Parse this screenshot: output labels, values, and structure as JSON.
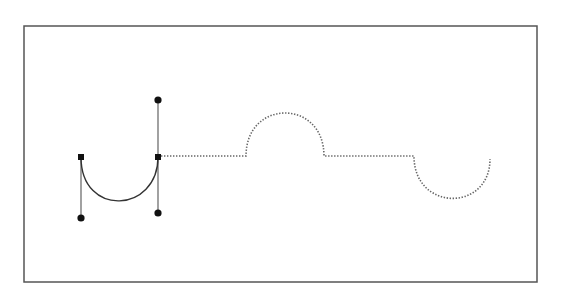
{
  "diagram": {
    "type": "bezier-path-illustration",
    "canvas": {
      "width": 564,
      "height": 299,
      "background": "#ffffff"
    },
    "frame": {
      "x": 24,
      "y": 26,
      "width": 513,
      "height": 256,
      "stroke": "#555555"
    },
    "solid_segment": {
      "description": "Drawn curve between two anchor points",
      "start": [
        81,
        157
      ],
      "control1": [
        81,
        218
      ],
      "control2": [
        158,
        213
      ],
      "end": [
        158,
        157
      ],
      "stroke": "#333333"
    },
    "anchors": [
      {
        "id": "anchor-left",
        "shape": "square",
        "x": 81,
        "y": 157
      },
      {
        "id": "anchor-right",
        "shape": "square",
        "x": 158,
        "y": 157
      }
    ],
    "handles": [
      {
        "id": "handle-left-bottom",
        "anchor": "anchor-left",
        "x": 81,
        "y": 218
      },
      {
        "id": "handle-right-top",
        "anchor": "anchor-right",
        "x": 158,
        "y": 100
      },
      {
        "id": "handle-right-bottom",
        "anchor": "anchor-right",
        "x": 158,
        "y": 213
      }
    ],
    "dotted_preview": {
      "description": "Dotted guide of the path still to be traced",
      "stroke": "#666666",
      "segments": [
        {
          "kind": "line",
          "from": [
            161,
            156
          ],
          "to": [
            246,
            156
          ]
        },
        {
          "kind": "arc-up",
          "from": [
            246,
            156
          ],
          "apex": [
            286,
            113
          ],
          "to": [
            324,
            156
          ]
        },
        {
          "kind": "line",
          "from": [
            324,
            156
          ],
          "to": [
            414,
            156
          ]
        },
        {
          "kind": "arc-down",
          "from": [
            414,
            156
          ],
          "bottom": [
            452,
            198
          ],
          "to": [
            490,
            159
          ]
        }
      ]
    }
  }
}
